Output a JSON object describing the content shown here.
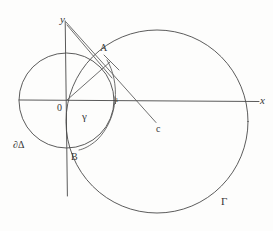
{
  "figure": {
    "background_color": "#fdfdfc",
    "stroke_color": "#4a4a4a",
    "label_color": "#363636",
    "axes": {
      "x_label": "x",
      "y_label": "y",
      "origin_label": "0",
      "unit_tick_label": "1"
    },
    "points": {
      "a_label": "A",
      "b_label": "B",
      "c_label": "c"
    },
    "curves": {
      "small_circle_label": "∂Δ",
      "large_circle_label": "Γ",
      "arc_label": "γ"
    }
  }
}
